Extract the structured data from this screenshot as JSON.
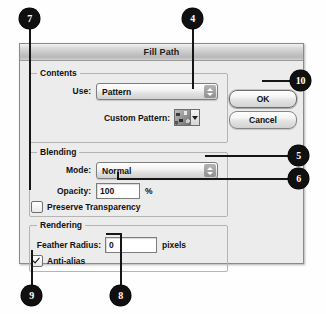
{
  "window": {
    "title": "Fill Path"
  },
  "groups": {
    "contents": {
      "title": "Contents",
      "use_label": "Use:",
      "use_value": "Pattern",
      "custom_pattern_label": "Custom Pattern:"
    },
    "blending": {
      "title": "Blending",
      "mode_label": "Mode:",
      "mode_value": "Normal",
      "opacity_label": "Opacity:",
      "opacity_value": "100",
      "opacity_unit": "%",
      "preserve_transparency_label": "Preserve Transparency",
      "preserve_transparency_checked": false
    },
    "rendering": {
      "title": "Rendering",
      "feather_label": "Feather Radius:",
      "feather_value": "0",
      "feather_unit": "pixels",
      "antialias_label": "Anti-alias",
      "antialias_checked": true
    }
  },
  "buttons": {
    "ok": "OK",
    "cancel": "Cancel"
  },
  "callouts": [
    {
      "id": "callout-7",
      "number": "7"
    },
    {
      "id": "callout-4",
      "number": "4"
    },
    {
      "id": "callout-10",
      "number": "10"
    },
    {
      "id": "callout-5",
      "number": "5"
    },
    {
      "id": "callout-6",
      "number": "6"
    },
    {
      "id": "callout-9",
      "number": "9"
    },
    {
      "id": "callout-8",
      "number": "8"
    }
  ],
  "colors": {
    "callout_fill": "#101010",
    "callout_text": "#ffffff",
    "dialog_bg": "#ececec",
    "group_border": "#b4b4b4",
    "text": "#111111"
  }
}
